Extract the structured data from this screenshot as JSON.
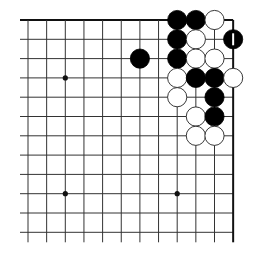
{
  "board": {
    "type": "go-diagram",
    "region": "top-right corner",
    "columns": 12,
    "rows": 12,
    "origin_x": 28,
    "origin_y": 20,
    "spacing_x": 18.65,
    "spacing_y": 19.3,
    "line_extend_bottom": 10,
    "line_extend_left": 8,
    "line_color": "#333333",
    "edge_color": "#111111",
    "star_points": [
      [
        2,
        3
      ],
      [
        2,
        9
      ],
      [
        8,
        9
      ]
    ],
    "stones": [
      {
        "col": 8,
        "row": 0,
        "color": "black"
      },
      {
        "col": 9,
        "row": 0,
        "color": "black"
      },
      {
        "col": 10,
        "row": 0,
        "color": "white"
      },
      {
        "col": 8,
        "row": 1,
        "color": "black"
      },
      {
        "col": 9,
        "row": 1,
        "color": "white"
      },
      {
        "col": 11,
        "row": 1,
        "color": "black",
        "marked": true
      },
      {
        "col": 6,
        "row": 2,
        "color": "black"
      },
      {
        "col": 8,
        "row": 2,
        "color": "black"
      },
      {
        "col": 9,
        "row": 2,
        "color": "white"
      },
      {
        "col": 10,
        "row": 2,
        "color": "white"
      },
      {
        "col": 8,
        "row": 3,
        "color": "white"
      },
      {
        "col": 9,
        "row": 3,
        "color": "black"
      },
      {
        "col": 10,
        "row": 3,
        "color": "black"
      },
      {
        "col": 11,
        "row": 3,
        "color": "white"
      },
      {
        "col": 8,
        "row": 4,
        "color": "white"
      },
      {
        "col": 10,
        "row": 4,
        "color": "black"
      },
      {
        "col": 9,
        "row": 5,
        "color": "white"
      },
      {
        "col": 10,
        "row": 5,
        "color": "black"
      },
      {
        "col": 9,
        "row": 6,
        "color": "white"
      },
      {
        "col": 10,
        "row": 6,
        "color": "white"
      }
    ]
  }
}
